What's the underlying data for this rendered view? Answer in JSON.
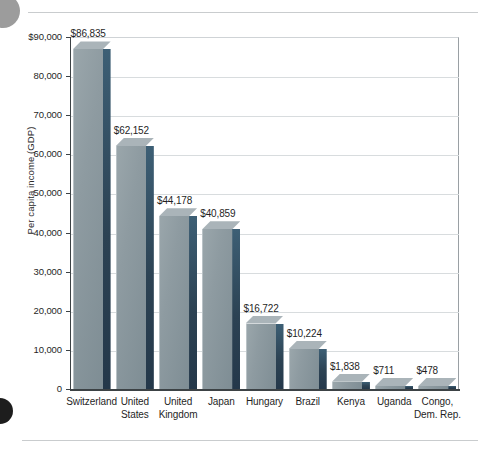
{
  "chart_data": {
    "type": "bar",
    "title": "",
    "xlabel": "",
    "ylabel": "Per capita income (GDP)",
    "ylim": [
      0,
      90000
    ],
    "grid": true,
    "legend": "none",
    "ytick_labels": [
      "$90,000",
      "80,000",
      "70,000",
      "60,000",
      "50,000",
      "40,000",
      "30,000",
      "20,000",
      "10,000",
      "0"
    ],
    "ytick_values": [
      90000,
      80000,
      70000,
      60000,
      50000,
      40000,
      30000,
      20000,
      10000,
      0
    ],
    "categories": [
      "Switzerland",
      "United States",
      "United Kingdom",
      "Japan",
      "Hungary",
      "Brazil",
      "Kenya",
      "Uganda",
      "Congo, Dem. Rep."
    ],
    "category_lines": [
      [
        "Switzerland"
      ],
      [
        "United",
        "States"
      ],
      [
        "United",
        "Kingdom"
      ],
      [
        "Japan"
      ],
      [
        "Hungary"
      ],
      [
        "Brazil"
      ],
      [
        "Kenya"
      ],
      [
        "Uganda"
      ],
      [
        "Congo,",
        "Dem. Rep."
      ]
    ],
    "values": [
      86835,
      62152,
      44178,
      40859,
      16722,
      10224,
      1838,
      711,
      478
    ],
    "value_labels": [
      "$86,835",
      "$62,152",
      "$44,178",
      "$40,859",
      "$16,722",
      "$10,224",
      "$1,838",
      "$711",
      "$478"
    ],
    "colors": {
      "bar_front": "#8e9ba1",
      "bar_side": "#2c4253",
      "bar_top": "#aab4b9",
      "gridline": "#d8dcde",
      "axis": "#3c4245",
      "text": "#1f1f1f"
    }
  }
}
